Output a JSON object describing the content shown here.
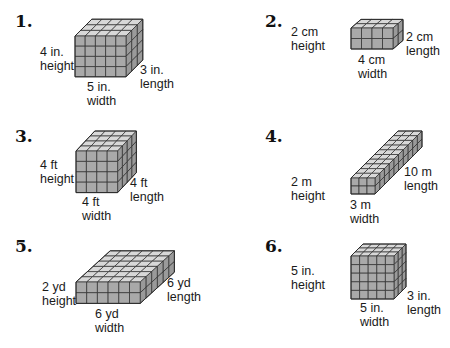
{
  "worksheet": {
    "colors": {
      "front_face": "#a9a9a9",
      "top_face": "#d8d8d8",
      "side_face": "#9a9a9a",
      "grid_line": "#2b2b2b",
      "highlight": "#e6e6e6"
    },
    "problems": [
      {
        "number": "1.",
        "solid": {
          "width_units": 5,
          "height_units": 4,
          "length_units": 3,
          "front_x": 75,
          "front_y": 36,
          "cell": 10.2,
          "dx": 5.6,
          "dy": -5.6
        },
        "labels": {
          "height_value": "4 in.",
          "height_word": "height",
          "width_value": "5 in.",
          "width_word": "width",
          "length_value": "3 in.",
          "length_word": "length"
        }
      },
      {
        "number": "2.",
        "solid": {
          "width_units": 4,
          "height_units": 2,
          "length_units": 2,
          "front_x": 351,
          "front_y": 28,
          "cell": 10.5,
          "dx": 5.0,
          "dy": -4.3
        },
        "labels": {
          "height_value": "2 cm",
          "height_word": "height",
          "width_value": "4 cm",
          "width_word": "width",
          "length_value": "2 cm",
          "length_word": "length"
        }
      },
      {
        "number": "3.",
        "solid": {
          "width_units": 4,
          "height_units": 4,
          "length_units": 4,
          "front_x": 76,
          "front_y": 151,
          "cell": 10.4,
          "dx": 4.7,
          "dy": -5.0
        },
        "labels": {
          "height_value": "4 ft",
          "height_word": "height",
          "width_value": "4 ft",
          "width_word": "width",
          "length_value": "4 ft",
          "length_word": "length"
        }
      },
      {
        "number": "4.",
        "solid": {
          "width_units": 3,
          "height_units": 2,
          "length_units": 10,
          "front_x": 351,
          "front_y": 178,
          "cell": 8.0,
          "dx": 4.7,
          "dy": -4.7
        },
        "labels": {
          "height_value": "2 m",
          "height_word": "height",
          "width_value": "3 m",
          "width_word": "width",
          "length_value": "10 m",
          "length_word": "length"
        }
      },
      {
        "number": "5.",
        "solid": {
          "width_units": 6,
          "height_units": 2,
          "length_units": 6,
          "front_x": 76,
          "front_y": 282,
          "cell": 10.7,
          "dx": 5.7,
          "dy": -5.2
        },
        "labels": {
          "height_value": "2 yd",
          "height_word": "height",
          "width_value": "6 yd",
          "width_word": "width",
          "length_value": "6 yd",
          "length_word": "length"
        }
      },
      {
        "number": "6.",
        "solid": {
          "width_units": 5,
          "height_units": 5,
          "length_units": 3,
          "front_x": 351,
          "front_y": 256,
          "cell": 8.6,
          "dx": 4.0,
          "dy": -4.0
        },
        "labels": {
          "height_value": "5 in.",
          "height_word": "height",
          "width_value": "5 in.",
          "width_word": "width",
          "length_value": "3 in.",
          "length_word": "length"
        }
      }
    ]
  }
}
